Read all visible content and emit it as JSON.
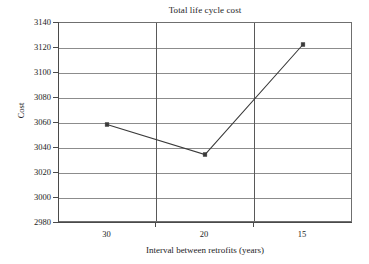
{
  "chart_data": {
    "type": "line",
    "title": "Total life cycle cost",
    "xlabel": "Interval between retrofits (years)",
    "ylabel": "Cost",
    "categories": [
      "30",
      "20",
      "15"
    ],
    "values": [
      3058,
      3034,
      3122
    ],
    "series": [
      {
        "name": "Total life cycle cost",
        "values": [
          3058,
          3034,
          3122
        ]
      }
    ],
    "ylim": [
      2980,
      3140
    ],
    "yticks": [
      3140,
      3120,
      3100,
      3080,
      3060,
      3040,
      3020,
      3000,
      2980
    ],
    "ytick_labels": [
      "3140",
      "3120",
      "3100",
      "3080",
      "3060",
      "3040",
      "3020",
      "3000",
      "2980"
    ],
    "xticks": [
      "30",
      "20",
      "15"
    ],
    "grid": "horizontal-and-category-dividers",
    "legend": "none",
    "marker": "square",
    "line_color": "#3a3a3a",
    "grid_color": "#8c8c8c",
    "axis_color": "#4a4a4a",
    "background_color": "#ffffff"
  }
}
